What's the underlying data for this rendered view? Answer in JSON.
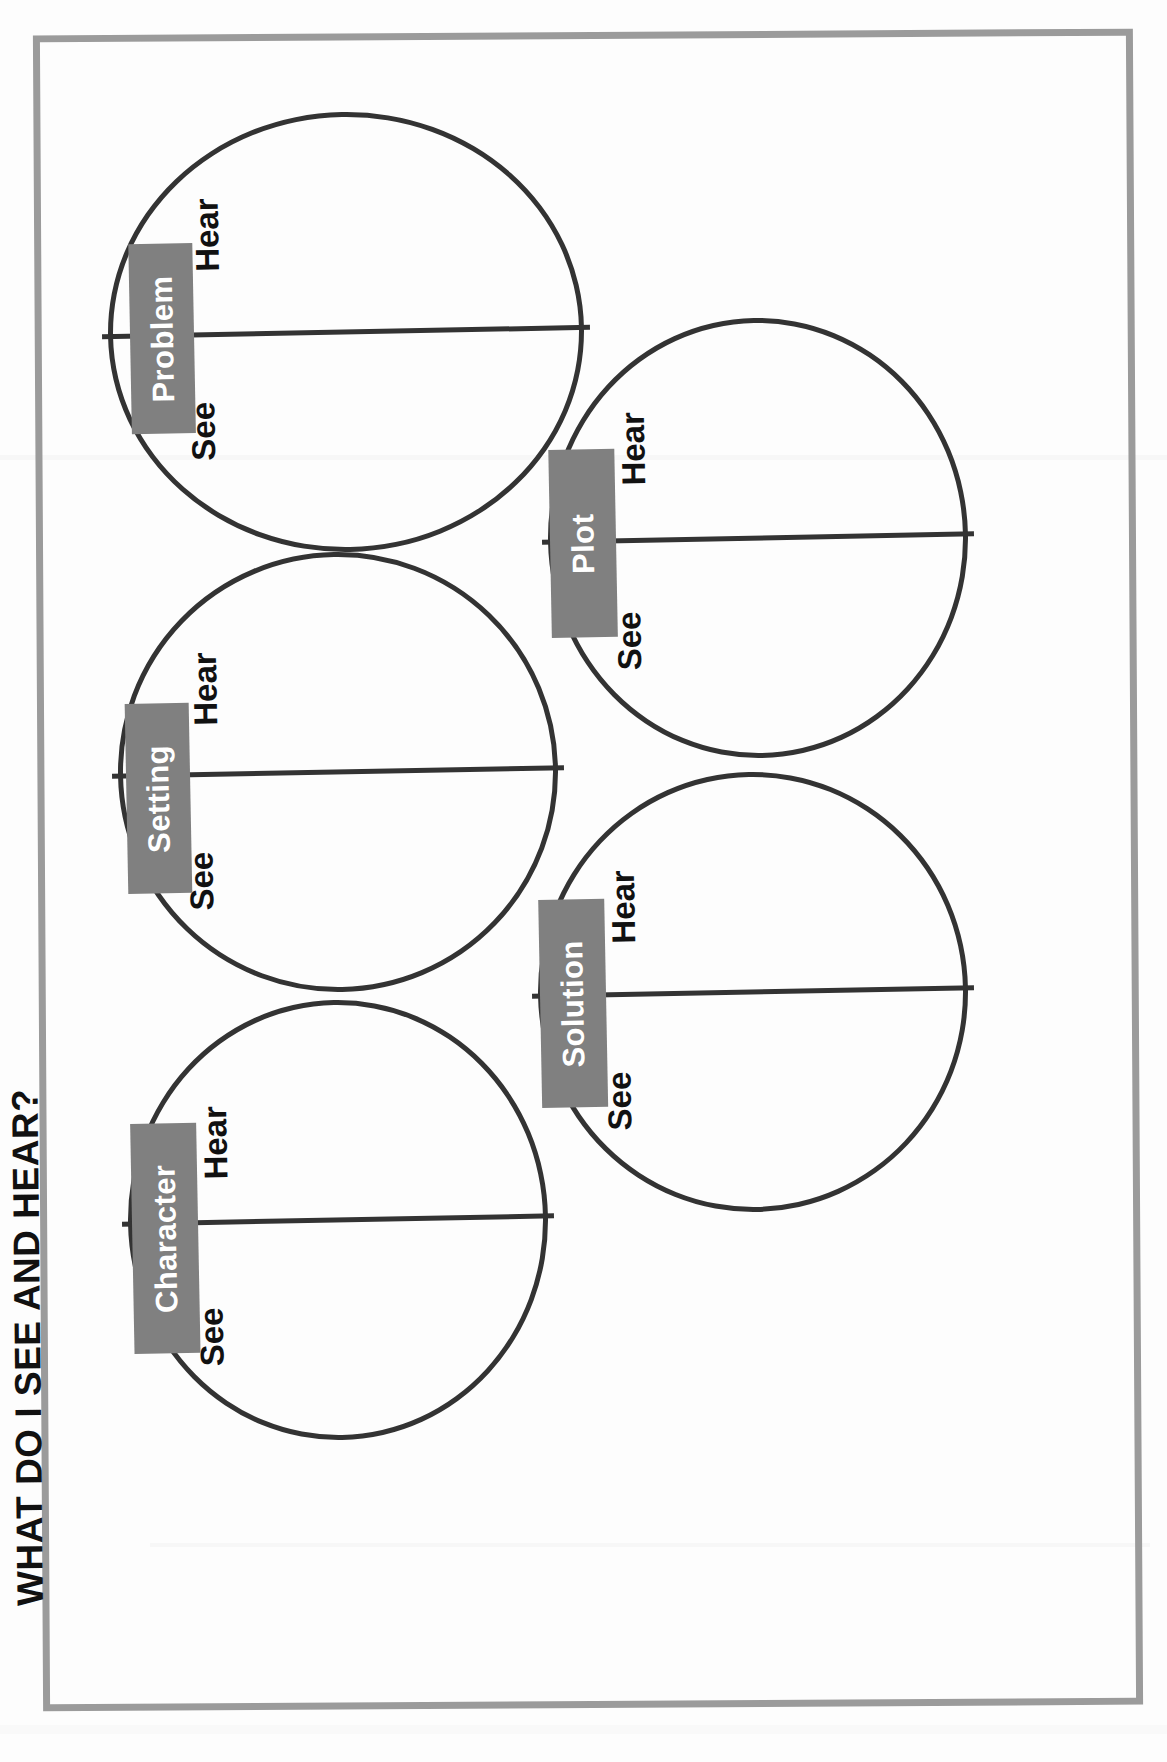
{
  "worksheet": {
    "title": "WHAT DO I SEE AND HEAR?",
    "border_color": "#9b9b9b",
    "page_background": "#fdfdfd",
    "circle_stroke_color": "#333333",
    "chip_background_color": "#808080",
    "chip_text_color": "#ffffff",
    "label_text_color": "#111111"
  },
  "circles": [
    {
      "id": "problem",
      "label": "Problem",
      "upper_half_label": "Hear",
      "lower_half_label": "See",
      "column": "left",
      "order": 1
    },
    {
      "id": "setting",
      "label": "Setting",
      "upper_half_label": "Hear",
      "lower_half_label": "See",
      "column": "left",
      "order": 2
    },
    {
      "id": "character",
      "label": "Character",
      "upper_half_label": "Hear",
      "lower_half_label": "See",
      "column": "left",
      "order": 3
    },
    {
      "id": "plot",
      "label": "Plot",
      "upper_half_label": "Hear",
      "lower_half_label": "See",
      "column": "right",
      "order": 4
    },
    {
      "id": "solution",
      "label": "Solution",
      "upper_half_label": "Hear",
      "lower_half_label": "See",
      "column": "right",
      "order": 5
    }
  ]
}
